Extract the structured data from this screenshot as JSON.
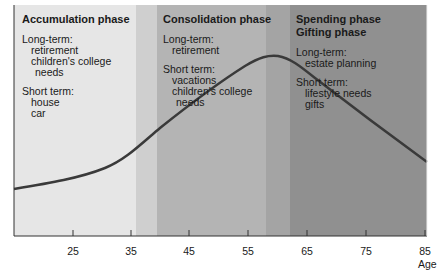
{
  "diagram": {
    "type": "life-cycle-of-financial-planning",
    "xlabel": "Age",
    "x_ticks": [
      "25",
      "35",
      "45",
      "55",
      "65",
      "75",
      "85"
    ],
    "colors": {
      "accumulation_band": "#e6e6e6",
      "transition_1": "#cfcfcf",
      "consolidation_band": "#b3b3b3",
      "transition_2": "#a3a3a3",
      "spending_band": "#8f8f8f",
      "curve": "#3a3a3a",
      "axis": "#333333"
    },
    "phases": [
      {
        "title": "Accumulation phase",
        "long_term_label": "Long-term:",
        "long_term_items": [
          "retirement",
          "children's college",
          "needs"
        ],
        "short_term_label": "Short term:",
        "short_term_items": [
          "house",
          "car"
        ]
      },
      {
        "title": "Consolidation phase",
        "long_term_label": "Long-term:",
        "long_term_items": [
          "retirement"
        ],
        "short_term_label": "Short term:",
        "short_term_items": [
          "vacations",
          "children's college",
          "needs"
        ]
      },
      {
        "title": "Spending phase",
        "title2": "Gifting phase",
        "long_term_label": "Long-term:",
        "long_term_items": [
          "estate planning"
        ],
        "short_term_label": "Short term:",
        "short_term_items": [
          "lifestyle needs",
          "gifts"
        ]
      }
    ],
    "curve_description": "Net worth rises from age ~18, peaks around age 59-60, then declines toward 85"
  }
}
